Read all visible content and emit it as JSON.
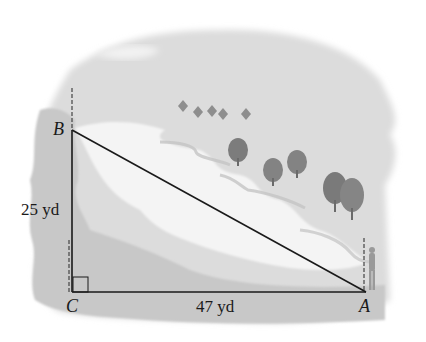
{
  "diagram": {
    "type": "right-triangle-word-problem",
    "scene": "river landscape with trees and a surveyor standing at point A",
    "vertices": [
      {
        "id": "B",
        "label": "B",
        "position": "top-left"
      },
      {
        "id": "C",
        "label": "C",
        "position": "bottom-left",
        "right_angle": true
      },
      {
        "id": "A",
        "label": "A",
        "position": "bottom-right"
      }
    ],
    "sides": [
      {
        "from": "B",
        "to": "C",
        "label": "25 yd"
      },
      {
        "from": "C",
        "to": "A",
        "label": "47 yd"
      },
      {
        "from": "B",
        "to": "A",
        "label": ""
      }
    ],
    "colors": {
      "line": "#1a1a1a",
      "land": "#d6d6d6",
      "land_dark": "#bdbdbd",
      "water": "#f3f3f3",
      "tree": "#8a8a8a"
    }
  }
}
